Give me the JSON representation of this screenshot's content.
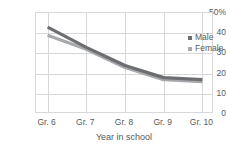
{
  "chart_data": {
    "type": "line",
    "title": "",
    "xlabel": "Year in school",
    "ylabel": "",
    "categories": [
      "Gr. 6",
      "Gr. 7",
      "Gr. 8",
      "Gr. 9",
      "Gr. 10"
    ],
    "ylim": [
      0,
      50
    ],
    "ytick_labels": [
      "50%",
      "40",
      "30",
      "20",
      "10",
      "0"
    ],
    "ytick_values": [
      50,
      40,
      30,
      20,
      10,
      0
    ],
    "grid": true,
    "legend_position": "top-right-inside",
    "series": [
      {
        "name": "Male",
        "color": "#6d6e71",
        "values": [
          43,
          33,
          24,
          18,
          17
        ]
      },
      {
        "name": "Female",
        "color": "#a7a9ac",
        "values": [
          39,
          32,
          23,
          17,
          16
        ]
      }
    ]
  },
  "axis": {
    "y_title_cropped": "%",
    "x_title": "Year in school"
  },
  "legend": {
    "items": [
      {
        "label": "Male",
        "marker_color": "#6d6e71"
      },
      {
        "label": "Female",
        "marker_color": "#a7a9ac"
      }
    ]
  },
  "colors": {
    "grid": "#d7d8da",
    "text": "#58595b",
    "male": "#6d6e71",
    "female": "#a7a9ac"
  }
}
